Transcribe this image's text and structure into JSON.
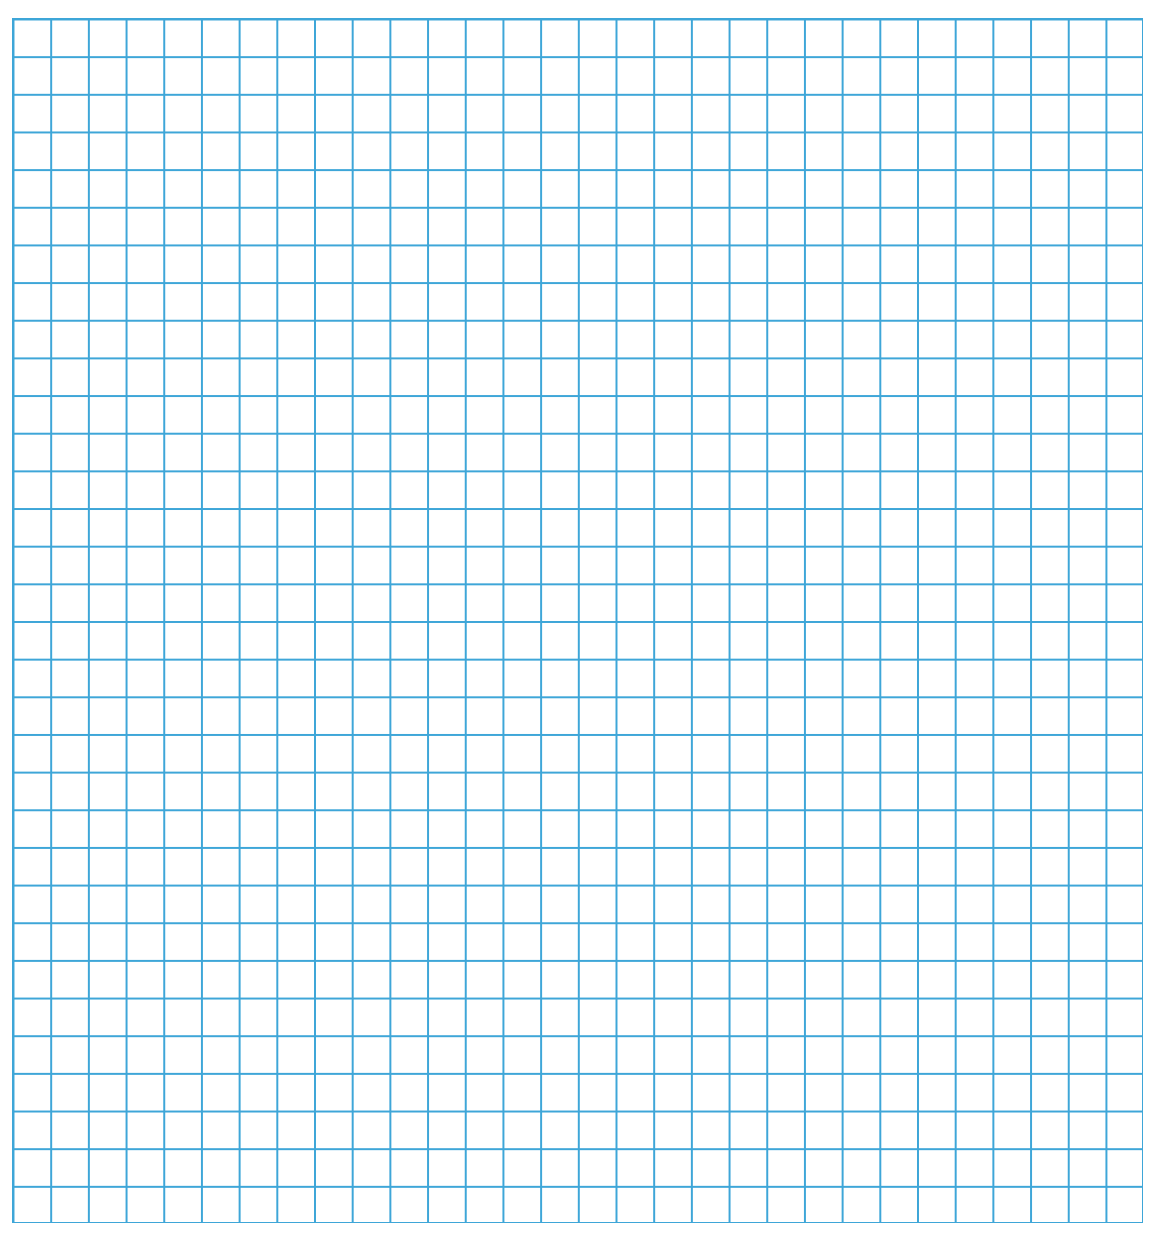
{
  "sheet": {
    "type": "graph-paper",
    "columns": 30,
    "rows": 32,
    "line_color": "#3ea6d8",
    "background_color": "#ffffff"
  }
}
